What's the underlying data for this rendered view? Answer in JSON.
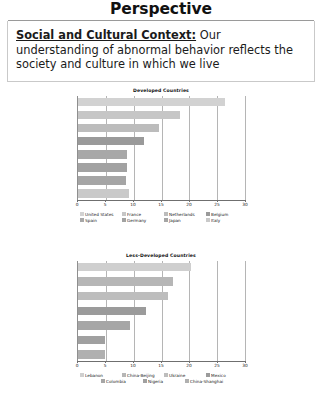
{
  "header": {
    "title": "Perspective"
  },
  "statement": {
    "lead": "Social and Cultural Context:",
    "body": " Our understanding of abnormal behavior reflects the society and culture in which we live"
  },
  "chart_data": [
    {
      "id": "developed",
      "type": "bar",
      "orientation": "horizontal",
      "title": "Developed Countries",
      "xlabel": "",
      "ylabel": "",
      "xlim": [
        0,
        30
      ],
      "ticks": [
        0,
        5,
        10,
        15,
        20,
        25,
        30
      ],
      "grid": true,
      "legend_position": "bottom",
      "categories": [
        "United States",
        "France",
        "Netherlands",
        "Belgium",
        "Spain",
        "Germany",
        "Japan",
        "Italy"
      ],
      "values": [
        26.4,
        18.4,
        14.6,
        11.9,
        8.8,
        8.8,
        8.6,
        9.2
      ],
      "colors": [
        "#d2d2d2",
        "#c6c6c6",
        "#bcbcbc",
        "#9a9a9a",
        "#a8a8a8",
        "#a2a2a2",
        "#a5a5a5",
        "#c9c9c9"
      ]
    },
    {
      "id": "less-developed",
      "type": "bar",
      "orientation": "horizontal",
      "title": "Less-Developed Countries",
      "xlabel": "",
      "ylabel": "",
      "xlim": [
        0,
        30
      ],
      "ticks": [
        0,
        5,
        10,
        15,
        20,
        25,
        30
      ],
      "grid": true,
      "legend_position": "bottom",
      "categories": [
        "Lebanon",
        "China-Beijing",
        "Ukraine",
        "Mexico",
        "Colombia",
        "Nigeria",
        "China-Shanghai"
      ],
      "values": [
        20.3,
        17.0,
        16.2,
        12.2,
        9.4,
        4.9,
        4.8
      ],
      "colors": [
        "#cfcfcf",
        "#b6b6b6",
        "#bdbdbd",
        "#9b9b9b",
        "#a6a6a6",
        "#a0a0a0",
        "#b0b0b0"
      ]
    }
  ]
}
